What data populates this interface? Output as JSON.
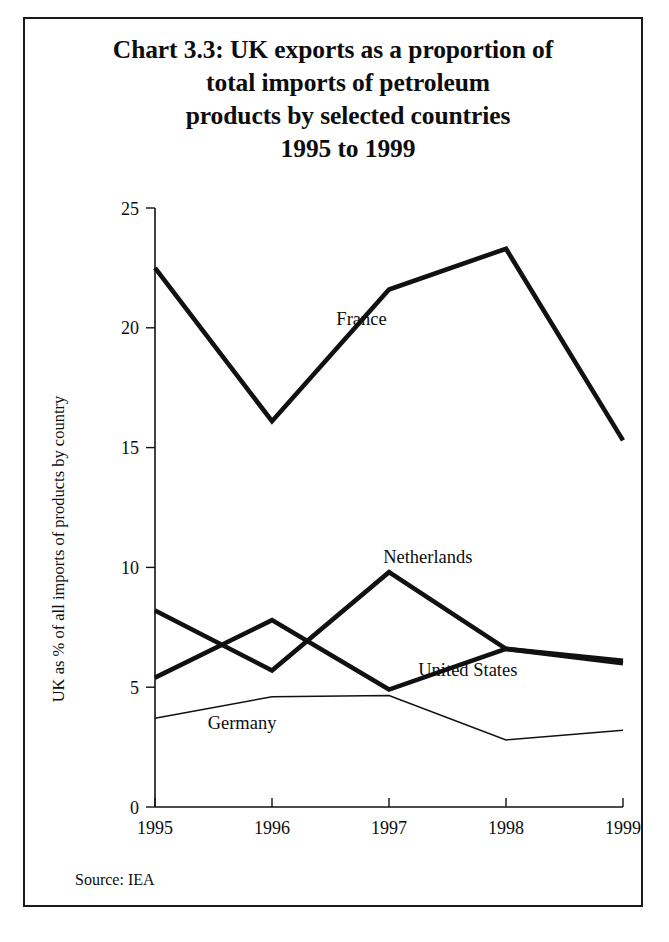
{
  "figure": {
    "title_lines": [
      "Chart 3.3: UK exports as a proportion of",
      "total imports of petroleum",
      "products by selected countries",
      "1995 to 1999"
    ],
    "source": "Source: IEA"
  },
  "chart_data": {
    "type": "line",
    "title": "Chart 3.3: UK exports as a proportion of total imports of petroleum products by selected countries 1995 to 1999",
    "xlabel": "",
    "ylabel": "UK as % of all imports of products by country",
    "categories": [
      "1995",
      "1996",
      "1997",
      "1998",
      "1999"
    ],
    "x_tick_labels": [
      "1995",
      "1996",
      "1997",
      "1998",
      "1999"
    ],
    "y_tick_labels": [
      "0",
      "5",
      "10",
      "15",
      "20",
      "25"
    ],
    "y_ticks": [
      0,
      5,
      10,
      15,
      20,
      25
    ],
    "ylim": [
      0,
      25
    ],
    "grid": false,
    "legend": "inline-labels",
    "series": [
      {
        "name": "France",
        "values": [
          22.5,
          16.1,
          21.6,
          23.3,
          15.3
        ],
        "style": "thick",
        "color": "#111111",
        "label_x": 1996.55,
        "label_y": 20.1
      },
      {
        "name": "Netherlands",
        "values": [
          8.2,
          5.7,
          9.8,
          6.6,
          6.1
        ],
        "style": "thick",
        "color": "#111111",
        "label_x": 1996.95,
        "label_y": 10.2
      },
      {
        "name": "United States",
        "values": [
          5.4,
          7.8,
          4.9,
          6.6,
          6.0
        ],
        "style": "thick",
        "color": "#111111",
        "label_x": 1997.25,
        "label_y": 5.45
      },
      {
        "name": "Germany",
        "values": [
          3.7,
          4.6,
          4.65,
          2.8,
          3.2
        ],
        "style": "thin",
        "color": "#111111",
        "label_x": 1995.45,
        "label_y": 3.25
      }
    ]
  }
}
